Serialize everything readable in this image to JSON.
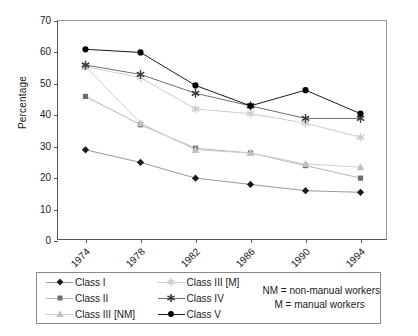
{
  "chart_data": {
    "type": "line",
    "title": "",
    "xlabel": "",
    "ylabel": "Percentage",
    "categories": [
      "1974",
      "1978",
      "1982",
      "1986",
      "1990",
      "1994"
    ],
    "ylim": [
      0,
      70
    ],
    "yticks": [
      0,
      10,
      20,
      30,
      40,
      50,
      60,
      70
    ],
    "grid": false,
    "legend_position": "bottom",
    "series": [
      {
        "name": "Class I",
        "marker": "diamond",
        "color": "#1a1a1a",
        "line_color": "#9a9a9a",
        "values": [
          29,
          25,
          20,
          18,
          16,
          15.5
        ]
      },
      {
        "name": "Class II",
        "marker": "square",
        "color": "#6e6e6e",
        "line_color": "#b5b5b5",
        "values": [
          46,
          37,
          29.5,
          28,
          24,
          20
        ]
      },
      {
        "name": "Class III [NM]",
        "marker": "triangle",
        "color": "#c2c2c2",
        "line_color": "#cfcfcf",
        "values": [
          55.5,
          37.5,
          29,
          28,
          24.5,
          23.5
        ]
      },
      {
        "name": "Class III [M]",
        "marker": "star",
        "color": "#cccccc",
        "line_color": "#cfcfcf",
        "values": [
          55.5,
          52,
          42,
          40.5,
          37.5,
          33
        ]
      },
      {
        "name": "Class IV",
        "marker": "star",
        "color": "#3d3d3d",
        "line_color": "#6e6e6e",
        "values": [
          56,
          53,
          47,
          43,
          39,
          39
        ]
      },
      {
        "name": "Class V",
        "marker": "circle",
        "color": "#000000",
        "line_color": "#1a1a1a",
        "values": [
          61,
          60,
          49.5,
          43,
          48,
          40.5
        ]
      }
    ],
    "notes": [
      "NM = non-manual workers",
      "M = manual workers"
    ]
  }
}
